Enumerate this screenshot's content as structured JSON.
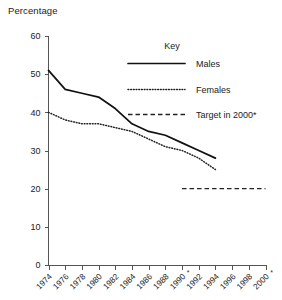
{
  "chart_data": {
    "type": "line",
    "title": "",
    "ylabel": "Percentage",
    "xlabel": "",
    "ylim": [
      0,
      60
    ],
    "ytick_values": [
      0,
      10,
      20,
      30,
      40,
      50,
      60
    ],
    "ytick_labels": [
      "0",
      "10",
      "20",
      "30",
      "40",
      "50",
      "60"
    ],
    "xlim": [
      1974,
      2000
    ],
    "xtick_values": [
      1974,
      1976,
      1978,
      1980,
      1982,
      1984,
      1986,
      1988,
      1990,
      1992,
      1994,
      1996,
      1998,
      2000
    ],
    "xtick_labels": [
      "1974",
      "1976",
      "1978",
      "1980",
      "1982",
      "1984",
      "1986",
      "1988",
      "1990",
      "1992",
      "1994",
      "1996",
      "1998",
      "2000"
    ],
    "xtick_asterisks": [
      1990,
      2000
    ],
    "grid": false,
    "legend_position": "upper-right-inside",
    "legend_title": "Key",
    "series": [
      {
        "name": "Males",
        "style": "solid",
        "x": [
          1974,
          1976,
          1978,
          1980,
          1982,
          1984,
          1986,
          1988,
          1990,
          1992,
          1994
        ],
        "values": [
          51,
          46,
          45,
          44,
          41,
          37,
          35,
          34,
          32,
          30,
          28
        ]
      },
      {
        "name": "Females",
        "style": "dotted",
        "x": [
          1974,
          1976,
          1978,
          1980,
          1982,
          1984,
          1986,
          1988,
          1990,
          1992,
          1994
        ],
        "values": [
          40,
          38,
          37,
          37,
          36,
          35,
          33,
          31,
          30,
          28,
          25
        ]
      },
      {
        "name": "Target in 2000*",
        "style": "dashed",
        "x": [
          1990,
          2000
        ],
        "values": [
          20,
          20
        ]
      }
    ]
  },
  "legend": {
    "title": "Key",
    "entries": [
      {
        "label": "Males",
        "style": "solid"
      },
      {
        "label": "Females",
        "style": "dotted"
      },
      {
        "label": "Target in 2000*",
        "style": "dashed"
      }
    ]
  },
  "axes": {
    "y_title": "Percentage"
  },
  "colors": {
    "line": "#111111",
    "axis": "#555555",
    "text": "#222222",
    "background": "#ffffff"
  }
}
